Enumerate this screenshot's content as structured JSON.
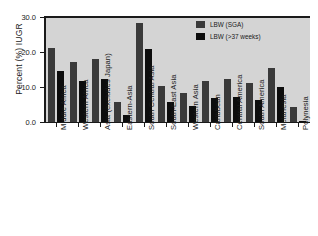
{
  "chart_data": {
    "type": "bar",
    "title": "",
    "xlabel": "",
    "ylabel": "Percent (%) IUGR",
    "ylim": [
      0.0,
      30.0
    ],
    "yticks": [
      "0.0",
      "10.0",
      "20.0",
      "30.0"
    ],
    "ytick_values": [
      0.0,
      10.0,
      20.0,
      30.0
    ],
    "grid": false,
    "legend_position": "top-right",
    "categories": [
      "Middle Africa",
      "Western Africa",
      "Asia (excludes Japan)",
      "Eastern-Asia",
      "South Central Asia",
      "South-East Asia",
      "Western Asia",
      "Caribbean",
      "Central America",
      "South America",
      "Melanesia",
      "Polynesia"
    ],
    "series": [
      {
        "name": "LBW (SGA)",
        "color": "#3a3a3a",
        "values": [
          21.1,
          17.2,
          17.9,
          5.8,
          28.2,
          10.3,
          8.4,
          11.7,
          12.4,
          11.2,
          15.5,
          4.2
        ]
      },
      {
        "name": "LBW (>37 weeks)",
        "color": "#0d0d0d",
        "values": [
          14.7,
          11.6,
          12.3,
          1.9,
          20.9,
          5.6,
          4.6,
          6.8,
          7.2,
          6.4,
          10.0,
          0.3
        ]
      }
    ]
  },
  "legend": {
    "entries": [
      {
        "label": "LBW (SGA)"
      },
      {
        "label": "LBW (>37 weeks)"
      }
    ]
  }
}
